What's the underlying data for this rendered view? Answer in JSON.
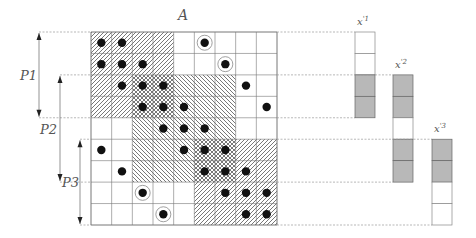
{
  "matrix": {
    "label": "A",
    "rows": 9,
    "cols": 9,
    "regions": [
      {
        "name": "block-top-left",
        "pattern": "diag-up",
        "r0": 0,
        "r1": 3,
        "c0": 0,
        "c1": 3
      },
      {
        "name": "block-middle",
        "pattern": "diag-down",
        "r0": 2,
        "r1": 6,
        "c0": 2,
        "c1": 6
      },
      {
        "name": "block-bottom-right",
        "pattern": "diag-up",
        "r0": 5,
        "r1": 8,
        "c0": 5,
        "c1": 8
      }
    ],
    "dots": [
      [
        0,
        0
      ],
      [
        0,
        1
      ],
      [
        1,
        0
      ],
      [
        1,
        1
      ],
      [
        1,
        2
      ],
      [
        2,
        1
      ],
      [
        2,
        2
      ],
      [
        2,
        3
      ],
      [
        2,
        7
      ],
      [
        3,
        2
      ],
      [
        3,
        3
      ],
      [
        3,
        4
      ],
      [
        3,
        8
      ],
      [
        4,
        3
      ],
      [
        4,
        4
      ],
      [
        4,
        5
      ],
      [
        5,
        0
      ],
      [
        5,
        4
      ],
      [
        5,
        5
      ],
      [
        5,
        6
      ],
      [
        6,
        1
      ],
      [
        6,
        5
      ],
      [
        6,
        6
      ],
      [
        6,
        7
      ],
      [
        7,
        6
      ],
      [
        7,
        7
      ],
      [
        7,
        8
      ],
      [
        8,
        7
      ],
      [
        8,
        8
      ]
    ],
    "circled_dots": [
      [
        0,
        5
      ],
      [
        1,
        6
      ],
      [
        7,
        2
      ],
      [
        8,
        3
      ]
    ]
  },
  "partitions": [
    {
      "label": "P1",
      "row_start": 0,
      "row_end": 4
    },
    {
      "label": "P2",
      "row_start": 2,
      "row_end": 7
    },
    {
      "label": "P3",
      "row_start": 5,
      "row_end": 9
    }
  ],
  "vectors": [
    {
      "label": "x'1",
      "row_start": 0,
      "cells": [
        "white",
        "white",
        "gray",
        "gray"
      ]
    },
    {
      "label": "x'2",
      "row_start": 2,
      "cells": [
        "gray",
        "gray",
        "white",
        "gray",
        "gray"
      ]
    },
    {
      "label": "x'3",
      "row_start": 5,
      "cells": [
        "gray",
        "gray",
        "white",
        "white"
      ]
    }
  ],
  "colors": {
    "line": "#777777",
    "hatch": "#555555",
    "dot": "#111111",
    "gray_cell": "#b8b8b8",
    "dash": "#999999"
  }
}
